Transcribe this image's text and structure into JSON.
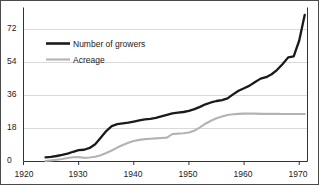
{
  "chart_data": {
    "type": "line",
    "title": "",
    "subtitle": "",
    "xlabel": "",
    "ylabel": "",
    "xlim": [
      1920,
      1971.5
    ],
    "ylim": [
      0,
      84
    ],
    "xticks": [
      1920,
      1930,
      1940,
      1950,
      1960,
      1970
    ],
    "xtick_labels": [
      "1920",
      "1930",
      "1940",
      "1950",
      "1960",
      "1970"
    ],
    "yticks": [
      0,
      18,
      36,
      54,
      72
    ],
    "ytick_labels": [
      "0",
      "18",
      "36",
      "54",
      "72"
    ],
    "grid": "horizontal",
    "grid_color": "#d9d9d9",
    "legend_position": "upper-left-inside",
    "series": [
      {
        "name": "Number of growers",
        "color": "#1a1a1a",
        "width": 2.3,
        "x": [
          1924,
          1925,
          1926,
          1927,
          1928,
          1929,
          1930,
          1931,
          1932,
          1933,
          1934,
          1935,
          1936,
          1937,
          1938,
          1939,
          1940,
          1941,
          1942,
          1943,
          1944,
          1945,
          1946,
          1947,
          1948,
          1949,
          1950,
          1951,
          1952,
          1953,
          1954,
          1955,
          1956,
          1957,
          1958,
          1959,
          1960,
          1961,
          1962,
          1963,
          1964,
          1965,
          1966,
          1967,
          1968,
          1969,
          1970,
          1971
        ],
        "values": [
          2.2,
          2.5,
          3.0,
          3.6,
          4.3,
          5.3,
          6.2,
          6.4,
          7.4,
          9.4,
          13.0,
          16.6,
          19.3,
          20.4,
          20.8,
          21.2,
          21.8,
          22.4,
          23.0,
          23.3,
          23.8,
          24.6,
          25.4,
          26.2,
          26.6,
          27.0,
          27.6,
          28.6,
          29.8,
          31.2,
          32.2,
          33.0,
          33.5,
          34.4,
          36.6,
          38.6,
          40.0,
          41.4,
          43.4,
          45.2,
          46.0,
          47.6,
          50.0,
          53.2,
          56.8,
          57.4,
          66.0,
          80.0
        ]
      },
      {
        "name": "Acreage",
        "color": "#b3b3b3",
        "width": 2.1,
        "x": [
          1924,
          1925,
          1926,
          1927,
          1928,
          1929,
          1930,
          1931,
          1932,
          1933,
          1934,
          1935,
          1936,
          1937,
          1938,
          1939,
          1940,
          1941,
          1942,
          1943,
          1944,
          1945,
          1946,
          1947,
          1948,
          1949,
          1950,
          1951,
          1952,
          1953,
          1954,
          1955,
          1956,
          1957,
          1958,
          1959,
          1960,
          1961,
          1962,
          1963,
          1964,
          1965,
          1966,
          1967,
          1968,
          1969,
          1970,
          1971
        ],
        "values": [
          0.3,
          0.6,
          1.0,
          1.4,
          1.9,
          2.3,
          2.4,
          2.0,
          2.2,
          2.6,
          3.4,
          4.6,
          6.0,
          7.6,
          9.0,
          10.2,
          11.2,
          11.8,
          12.2,
          12.4,
          12.6,
          12.8,
          13.0,
          15.0,
          15.2,
          15.4,
          15.8,
          16.8,
          18.6,
          20.6,
          22.2,
          23.6,
          24.6,
          25.4,
          25.8,
          26.0,
          26.1,
          26.1,
          26.1,
          26.0,
          26.0,
          26.0,
          26.0,
          25.9,
          25.9,
          25.9,
          25.9,
          25.9
        ]
      }
    ]
  },
  "legend": {
    "items": [
      {
        "label": "Number of growers",
        "color": "#1a1a1a"
      },
      {
        "label": "Acreage",
        "color": "#b3b3b3"
      }
    ]
  },
  "axes": {
    "y_labels": [
      "72",
      "54",
      "36",
      "18",
      "0"
    ],
    "x_labels": [
      "1920",
      "1930",
      "1940",
      "1950",
      "1960",
      "1970"
    ]
  },
  "colors": {
    "growers_line": "#1a1a1a",
    "acreage_line": "#b3b3b3",
    "gridline": "#d9d9d9",
    "axis": "#333333",
    "frame": "#4a4a4a",
    "background": "#ffffff"
  }
}
